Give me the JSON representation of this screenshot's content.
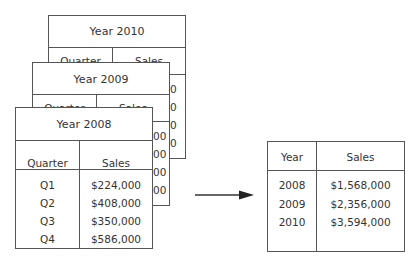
{
  "tables": {
    "y2010": {
      "title": "Year 2010",
      "headers": [
        "Quarter",
        "Sales"
      ],
      "peek_values": [
        "0",
        "0",
        "0",
        "0"
      ]
    },
    "y2009": {
      "title": "Year 2009",
      "headers": [
        "Quarter",
        "Sales"
      ],
      "peek_values": [
        "00",
        "00",
        "00",
        "00"
      ]
    },
    "y2008": {
      "title": "Year 2008",
      "headers": [
        "Quarter",
        "Sales"
      ],
      "rows": [
        {
          "quarter": "Q1",
          "sales": "$224,000"
        },
        {
          "quarter": "Q2",
          "sales": "$408,000"
        },
        {
          "quarter": "Q3",
          "sales": "$350,000"
        },
        {
          "quarter": "Q4",
          "sales": "$586,000"
        }
      ]
    },
    "summary": {
      "headers": [
        "Year",
        "Sales"
      ],
      "rows": [
        {
          "year": "2008",
          "sales": "$1,568,000"
        },
        {
          "year": "2009",
          "sales": "$2,356,000"
        },
        {
          "year": "2010",
          "sales": "$3,594,000"
        }
      ]
    }
  },
  "arrow": {
    "direction": "right",
    "icon": "arrow-right-icon"
  },
  "colors": {
    "line": "#555555",
    "text": "#333333",
    "background": "#ffffff"
  }
}
